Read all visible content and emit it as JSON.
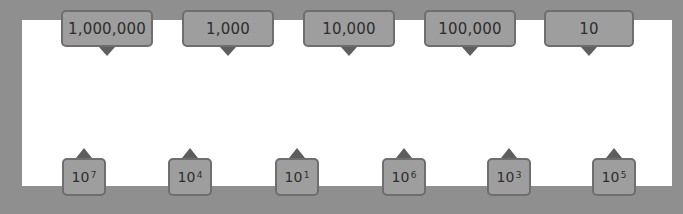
{
  "standard_numbers": [
    {
      "label": "1,000,000"
    },
    {
      "label": "1,000"
    },
    {
      "label": "10,000"
    },
    {
      "label": "100,000"
    },
    {
      "label": "10"
    }
  ],
  "powers_of_ten": [
    {
      "base": "10",
      "exponent": "7"
    },
    {
      "base": "10",
      "exponent": "4"
    },
    {
      "base": "10",
      "exponent": "1"
    },
    {
      "base": "10",
      "exponent": "6"
    },
    {
      "base": "10",
      "exponent": "3"
    },
    {
      "base": "10",
      "exponent": "5"
    }
  ],
  "colors": {
    "frame": "#8f8f8f",
    "panel": "#ffffff",
    "card_fill": "#9e9e9e",
    "card_border": "#6e6e6e",
    "pointer": "#5e5e5e"
  }
}
